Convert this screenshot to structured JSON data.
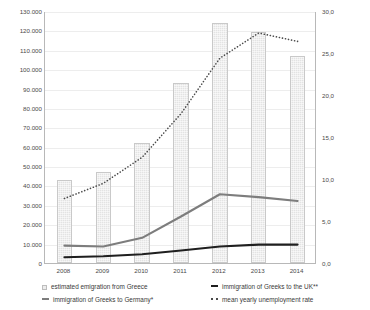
{
  "chart_data": {
    "type": "line",
    "title": "",
    "subtitle": "",
    "xlabel": "",
    "ylabel": "",
    "categories": [
      "2008",
      "2009",
      "2010",
      "2011",
      "2012",
      "2013",
      "2014"
    ],
    "axes": {
      "left": {
        "label": "",
        "ylim": [
          0,
          130000
        ],
        "ticks": [
          "0",
          "10.000",
          "20.000",
          "30.000",
          "40.000",
          "50.000",
          "60.000",
          "70.000",
          "80.000",
          "90.000",
          "100.000",
          "110.000",
          "120.000",
          "130.000"
        ],
        "tick_values": [
          0,
          10000,
          20000,
          30000,
          40000,
          50000,
          60000,
          70000,
          80000,
          90000,
          100000,
          110000,
          120000,
          130000
        ]
      },
      "right": {
        "label": "",
        "ylim": [
          0,
          30
        ],
        "ticks": [
          "0,0",
          "5,0",
          "10,0",
          "15,0",
          "20,0",
          "25,0",
          "30,0"
        ],
        "tick_values": [
          0,
          5,
          10,
          15,
          20,
          25,
          30
        ]
      }
    },
    "grid": true,
    "legend_position": "bottom",
    "series": [
      {
        "name": "estimated emigration from Greece",
        "type": "bar",
        "axis": "left",
        "color": "#e3e3e3",
        "values": [
          43000,
          47000,
          62000,
          93000,
          124000,
          119000,
          107000
        ]
      },
      {
        "name": "immigration of Greeks to Germany*",
        "type": "line",
        "axis": "left",
        "color": "#7d7d7d",
        "values": [
          9500,
          9000,
          13500,
          24500,
          36000,
          34500,
          32500
        ]
      },
      {
        "name": "immigration of Greeks to the UK**",
        "type": "line",
        "axis": "left",
        "color": "#1f1f1f",
        "values": [
          3500,
          4000,
          5000,
          7000,
          9000,
          10000,
          10000
        ]
      },
      {
        "name": "mean yearly unemployment rate",
        "type": "line",
        "axis": "right",
        "color": "#4a4a4a",
        "style": "dotted",
        "values": [
          7.8,
          9.6,
          12.7,
          17.9,
          24.5,
          27.5,
          26.5
        ]
      }
    ]
  },
  "legend": {
    "items": [
      {
        "label": "estimated emigration from Greece",
        "marker": "bar-swatch-icon"
      },
      {
        "label": "immigration of Greeks to the UK**",
        "marker": "line-swatch-icon"
      },
      {
        "label": "immigration of Greeks to Germany*",
        "marker": "line-swatch-icon"
      },
      {
        "label": "mean yearly unemployment rate",
        "marker": "dotted-line-swatch-icon"
      }
    ]
  }
}
